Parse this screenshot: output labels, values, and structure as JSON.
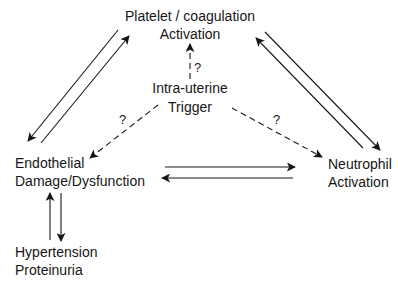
{
  "nodes": {
    "platelet": {
      "line1": "Platelet / coagulation",
      "line2": "Activation"
    },
    "trigger": {
      "line1": "Intra-uterine",
      "line2": "Trigger"
    },
    "endothelial": {
      "line1": "Endothelial",
      "line2": "Damage/Dysfunction"
    },
    "neutrophil": {
      "line1": "Neutrophil",
      "line2": "Activation"
    },
    "hypertension": {
      "line1": "Hypertension",
      "line2": "Proteinuria"
    }
  },
  "edges": [
    {
      "from": "platelet",
      "to": "endothelial",
      "style": "solid"
    },
    {
      "from": "endothelial",
      "to": "platelet",
      "style": "solid"
    },
    {
      "from": "platelet",
      "to": "neutrophil",
      "style": "solid"
    },
    {
      "from": "neutrophil",
      "to": "platelet",
      "style": "solid"
    },
    {
      "from": "endothelial",
      "to": "neutrophil",
      "style": "solid"
    },
    {
      "from": "neutrophil",
      "to": "endothelial",
      "style": "solid"
    },
    {
      "from": "hypertension",
      "to": "endothelial",
      "style": "solid"
    },
    {
      "from": "endothelial",
      "to": "hypertension",
      "style": "solid"
    },
    {
      "from": "trigger",
      "to": "platelet",
      "style": "dashed",
      "label": "?"
    },
    {
      "from": "trigger",
      "to": "endothelial",
      "style": "dashed",
      "label": "?"
    },
    {
      "from": "trigger",
      "to": "neutrophil",
      "style": "dashed",
      "label": "?"
    }
  ],
  "uncertainty_mark": "?"
}
